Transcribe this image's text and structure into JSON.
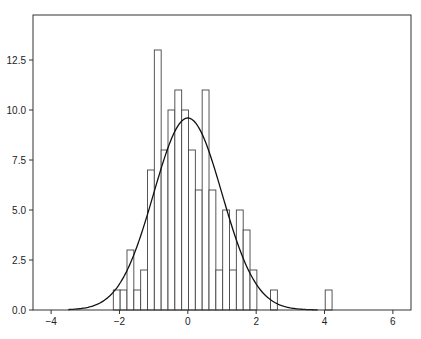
{
  "chart_data": {
    "type": "bar",
    "subtype": "histogram_with_normal_fit",
    "title": "",
    "xlabel": "",
    "ylabel": "",
    "xlim": [
      -4.53,
      6.53
    ],
    "ylim": [
      0,
      14.75
    ],
    "grid": false,
    "legend": null,
    "x_ticks": [
      -4,
      -2,
      0,
      2,
      4,
      6
    ],
    "x_tick_labels": [
      "−4",
      "−2",
      "0",
      "2",
      "4",
      "6"
    ],
    "y_ticks": [
      0.0,
      2.5,
      5.0,
      7.5,
      10.0,
      12.5
    ],
    "y_tick_labels": [
      "0.0",
      "2.5",
      "5.0",
      "7.5",
      "10.0",
      "12.5"
    ],
    "histogram": {
      "bin_start": -2.18,
      "bin_width": 0.2,
      "counts": [
        1,
        1,
        3,
        1,
        2,
        7,
        13,
        8,
        10,
        11,
        10,
        8,
        6,
        11,
        6,
        2,
        5,
        2,
        5,
        4,
        2,
        0,
        0,
        1,
        0,
        0,
        0,
        0,
        0,
        0,
        0,
        1
      ],
      "face_color": "#ffffff",
      "edge_color": "#444444"
    },
    "series": [
      {
        "name": "normal_fit",
        "type": "line",
        "mean": 0.0,
        "std": 1.0,
        "peak": 9.6,
        "x_range": [
          -3.5,
          3.8
        ],
        "color": "#111111"
      }
    ]
  }
}
